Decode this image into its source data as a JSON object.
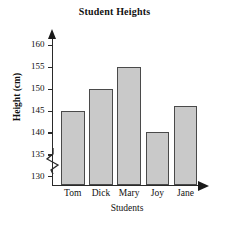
{
  "chart_data": {
    "type": "bar",
    "title": "Student Heights",
    "xlabel": "Students",
    "ylabel": "Height (cm)",
    "categories": [
      "Tom",
      "Dick",
      "Mary",
      "Joy",
      "Jane"
    ],
    "values": [
      145,
      150,
      155,
      140,
      146
    ],
    "ylim": [
      128,
      162
    ],
    "yticks": [
      130,
      135,
      140,
      145,
      150,
      155,
      160
    ],
    "ytick_labels": [
      "130",
      "135",
      "140",
      "145",
      "150",
      "155",
      "160"
    ],
    "axis_break": true,
    "axis_break_below": 130,
    "grid": false,
    "legend": null,
    "bar_fill_color": "#c9c9c9",
    "bar_edge_color": "#4a4a4a",
    "axis_color": "#2a2a2a"
  }
}
